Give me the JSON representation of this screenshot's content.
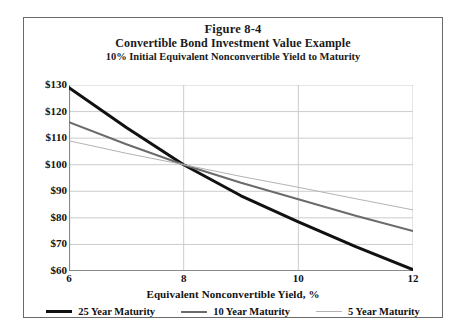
{
  "figure": {
    "title": "Figure 8-4",
    "subtitle": "Convertible Bond Investment Value Example",
    "subtitle2": "10% Initial Equivalent Nonconvertible Yield to Maturity"
  },
  "colors": {
    "series_25yr": "#111111",
    "series_10yr": "#6b6b6b",
    "series_5yr": "#b3b3b3",
    "grid": "#cccccc",
    "axis": "#8a8a8a",
    "border": "#6a6a6a",
    "text": "#111111"
  },
  "chart_data": {
    "type": "line",
    "title": "Convertible Bond Investment Value Example",
    "subtitle": "10% Initial Equivalent Nonconvertible Yield to Maturity",
    "xlabel": "Equivalent Nonconvertible Yield, %",
    "ylabel": "",
    "xlim": [
      6,
      12
    ],
    "ylim": [
      60,
      130
    ],
    "xticks": [
      6,
      8,
      10,
      12
    ],
    "xtick_labels": [
      "6",
      "8",
      "10",
      "12"
    ],
    "yticks": [
      60,
      70,
      80,
      90,
      100,
      110,
      120,
      130
    ],
    "ytick_labels": [
      "$60",
      "$70",
      "$80",
      "$90",
      "$100",
      "$110",
      "$120",
      "$130"
    ],
    "grid": true,
    "legend_position": "bottom",
    "x": [
      6,
      7,
      8,
      9,
      10,
      11,
      12
    ],
    "series": [
      {
        "name": "25 Year Maturity",
        "color": "#111111",
        "linewidth": 3,
        "values": [
          129.0,
          114.0,
          100.0,
          88.3,
          78.5,
          69.2,
          60.5
        ]
      },
      {
        "name": "10 Year Maturity",
        "color": "#6b6b6b",
        "linewidth": 2,
        "values": [
          116.0,
          107.7,
          100.0,
          93.2,
          87.0,
          80.8,
          75.0
        ]
      },
      {
        "name": "5 Year Maturity",
        "color": "#b3b3b3",
        "linewidth": 1,
        "values": [
          109.0,
          104.3,
          100.0,
          95.6,
          91.5,
          87.2,
          83.0
        ]
      }
    ]
  },
  "legend": {
    "items": [
      {
        "label": "25 Year Maturity"
      },
      {
        "label": "10 Year Maturity"
      },
      {
        "label": "5 Year Maturity"
      }
    ]
  }
}
